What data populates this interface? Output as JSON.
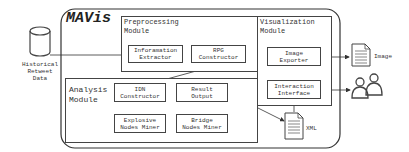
{
  "system": {
    "title": "MAVis"
  },
  "external": {
    "data_source": "Historical\nRetweet\nData",
    "image_output": "Image",
    "xml_file": "XML"
  },
  "modules": {
    "preprocessing": {
      "title": "Preprocessing\nModule",
      "components": [
        "Inforamation\nExtractor",
        "RPG\nConstructor"
      ]
    },
    "analysis": {
      "title": "Analysis\nModule",
      "components": [
        "IDN\nConstructor",
        "Result\nOutput",
        "Explosive\nNodes Miner",
        "Bridge\nNodes Miner"
      ]
    },
    "visualization": {
      "title": "Visualization\nModule",
      "components": [
        "Image\nExporter",
        "Interaction\nInterface"
      ]
    }
  }
}
